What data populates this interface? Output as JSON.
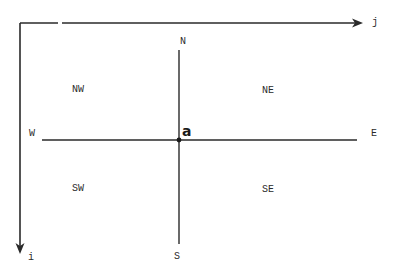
{
  "diagram": {
    "type": "compass-neighborhood-grid",
    "axes": {
      "column_axis_label": "j",
      "row_axis_label": "i"
    },
    "center_point": {
      "label": "a"
    },
    "directions": {
      "north": "N",
      "south": "S",
      "east": "E",
      "west": "W"
    },
    "quadrants": {
      "northwest": "NW",
      "northeast": "NE",
      "southwest": "SW",
      "southeast": "SE"
    },
    "colors": {
      "line": "#2a2a2a",
      "background": "#ffffff"
    }
  }
}
